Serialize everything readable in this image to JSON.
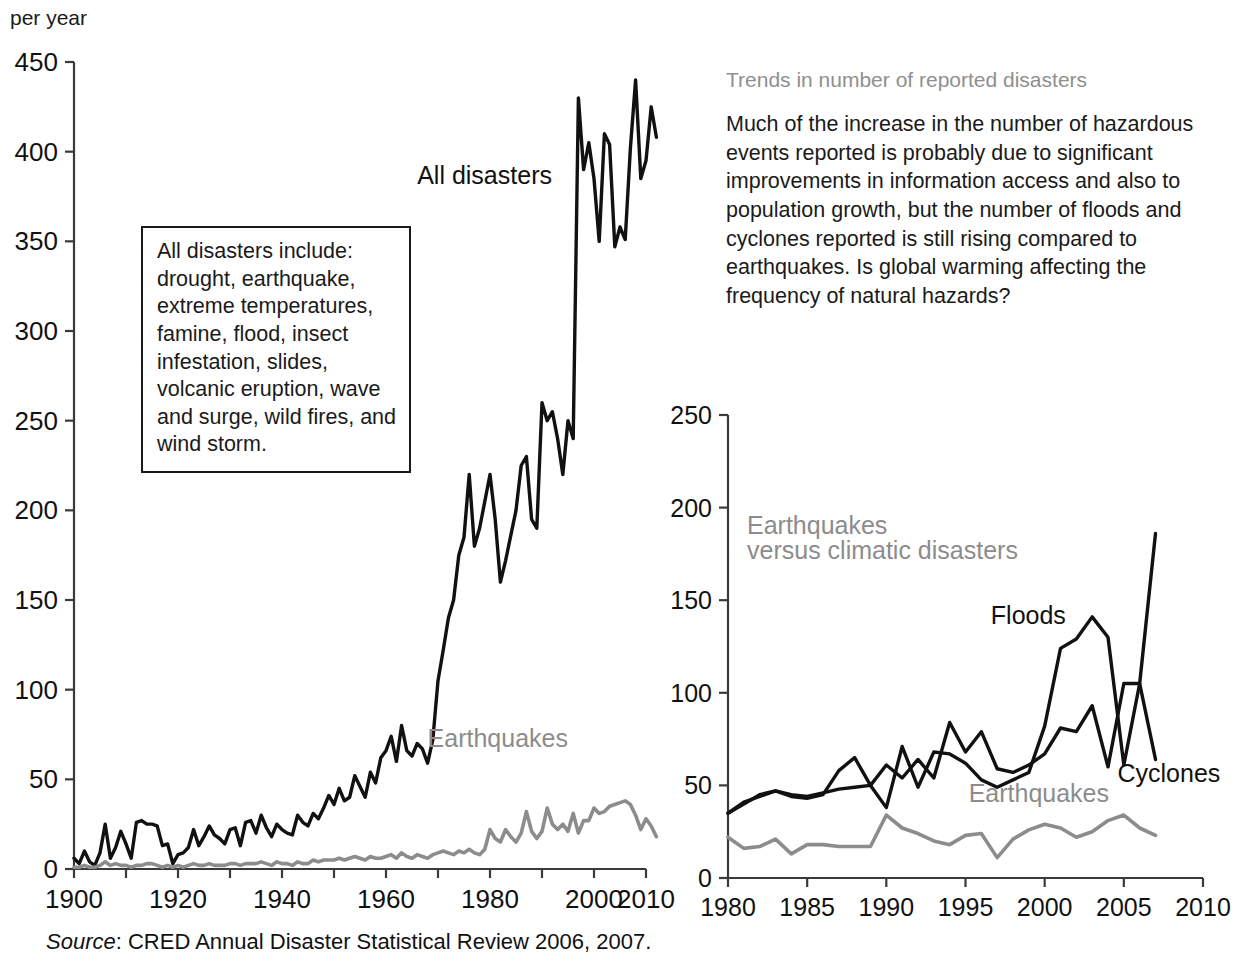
{
  "axis_label_top": "per year",
  "source": {
    "prefix": "Source",
    "text": ": CRED Annual Disaster Statistical Review 2006, 2007."
  },
  "sidebar": {
    "heading": "Trends in number of reported disasters",
    "body": "Much of the increase in the number of hazardous events reported is probably due to significant improvements in information access and also to population growth, but the number of floods and cyclones reported is still rising compared to earthquakes. Is global warming affecting the frequency of natural hazards?"
  },
  "callout": {
    "text": "All disasters include: drought, earthquake, extreme temperatures, famine, flood, insect infestation, slides, volcanic eruption, wave and surge, wild fires, and wind storm."
  },
  "chart_data": [
    {
      "id": "left",
      "type": "line",
      "title": "",
      "xlabel": "",
      "ylabel": "per year",
      "xlim": [
        1900,
        2010
      ],
      "ylim": [
        0,
        450
      ],
      "xticks": [
        1900,
        1910,
        1920,
        1930,
        1940,
        1950,
        1960,
        1970,
        1980,
        1990,
        2000,
        2010
      ],
      "xticklabels": [
        "1900",
        "",
        "1920",
        "",
        "1940",
        "",
        "1960",
        "",
        "1980",
        "",
        "2000",
        "2010"
      ],
      "yticks": [
        0,
        50,
        100,
        150,
        200,
        250,
        300,
        350,
        400,
        450
      ],
      "yticklabels": [
        "0",
        "50",
        "100",
        "150",
        "200",
        "250",
        "300",
        "350",
        "400",
        "450"
      ],
      "grid": false,
      "legend": "inline-annotations",
      "annotations": [
        {
          "text": "All disasters",
          "x": 1966,
          "y": 382,
          "color": "#111111"
        },
        {
          "text": "Earthquakes",
          "x": 1968,
          "y": 68,
          "color": "#8f8f8f"
        }
      ],
      "series": [
        {
          "name": "All disasters",
          "color": "#111111",
          "x": [
            1900,
            1901,
            1902,
            1903,
            1904,
            1905,
            1906,
            1907,
            1908,
            1909,
            1910,
            1911,
            1912,
            1913,
            1914,
            1915,
            1916,
            1917,
            1918,
            1919,
            1920,
            1921,
            1922,
            1923,
            1924,
            1925,
            1926,
            1927,
            1928,
            1929,
            1930,
            1931,
            1932,
            1933,
            1934,
            1935,
            1936,
            1937,
            1938,
            1939,
            1940,
            1941,
            1942,
            1943,
            1944,
            1945,
            1946,
            1947,
            1948,
            1949,
            1950,
            1951,
            1952,
            1953,
            1954,
            1955,
            1956,
            1957,
            1958,
            1959,
            1960,
            1961,
            1962,
            1963,
            1964,
            1965,
            1966,
            1967,
            1968,
            1969,
            1970,
            1971,
            1972,
            1973,
            1974,
            1975,
            1976,
            1977,
            1978,
            1979,
            1980,
            1981,
            1982,
            1983,
            1984,
            1985,
            1986,
            1987,
            1988,
            1989,
            1990,
            1991,
            1992,
            1993,
            1994,
            1995,
            1996,
            1997,
            1998,
            1999,
            2000,
            2001,
            2002,
            2003,
            2004,
            2005,
            2006,
            2007,
            2008,
            2009,
            2010,
            2011,
            2012
          ],
          "values": [
            6,
            3,
            10,
            4,
            2,
            9,
            25,
            6,
            12,
            21,
            14,
            6,
            26,
            27,
            25,
            25,
            24,
            13,
            14,
            3,
            8,
            9,
            12,
            22,
            13,
            18,
            24,
            19,
            17,
            14,
            22,
            23,
            13,
            26,
            27,
            20,
            30,
            23,
            18,
            25,
            22,
            20,
            19,
            30,
            26,
            24,
            31,
            28,
            34,
            41,
            36,
            45,
            38,
            40,
            52,
            46,
            40,
            54,
            48,
            62,
            66,
            74,
            60,
            80,
            66,
            63,
            70,
            67,
            59,
            72,
            105,
            122,
            140,
            150,
            175,
            185,
            220,
            180,
            190,
            205,
            220,
            195,
            160,
            172,
            186,
            200,
            225,
            230,
            195,
            190,
            260,
            250,
            255,
            240,
            220,
            250,
            240,
            430,
            390,
            405,
            385,
            350,
            410,
            404,
            347,
            358,
            351,
            402,
            440,
            385,
            395,
            425,
            408
          ]
        },
        {
          "name": "Earthquakes",
          "color": "#8f8f8f",
          "x": [
            1900,
            1901,
            1902,
            1903,
            1904,
            1905,
            1906,
            1907,
            1908,
            1909,
            1910,
            1911,
            1912,
            1913,
            1914,
            1915,
            1916,
            1917,
            1918,
            1919,
            1920,
            1921,
            1922,
            1923,
            1924,
            1925,
            1926,
            1927,
            1928,
            1929,
            1930,
            1931,
            1932,
            1933,
            1934,
            1935,
            1936,
            1937,
            1938,
            1939,
            1940,
            1941,
            1942,
            1943,
            1944,
            1945,
            1946,
            1947,
            1948,
            1949,
            1950,
            1951,
            1952,
            1953,
            1954,
            1955,
            1956,
            1957,
            1958,
            1959,
            1960,
            1961,
            1962,
            1963,
            1964,
            1965,
            1966,
            1967,
            1968,
            1969,
            1970,
            1971,
            1972,
            1973,
            1974,
            1975,
            1976,
            1977,
            1978,
            1979,
            1980,
            1981,
            1982,
            1983,
            1984,
            1985,
            1986,
            1987,
            1988,
            1989,
            1990,
            1991,
            1992,
            1993,
            1994,
            1995,
            1996,
            1997,
            1998,
            1999,
            2000,
            2001,
            2002,
            2003,
            2004,
            2005,
            2006,
            2007,
            2008,
            2009,
            2010,
            2011,
            2012
          ],
          "values": [
            1,
            1,
            2,
            1,
            1,
            2,
            4,
            2,
            3,
            2,
            2,
            1,
            2,
            2,
            3,
            3,
            2,
            1,
            2,
            1,
            2,
            1,
            2,
            3,
            2,
            2,
            3,
            2,
            2,
            2,
            3,
            3,
            2,
            3,
            3,
            3,
            4,
            3,
            2,
            4,
            3,
            3,
            2,
            4,
            3,
            3,
            5,
            4,
            5,
            5,
            5,
            6,
            5,
            6,
            7,
            6,
            5,
            7,
            6,
            6,
            7,
            8,
            6,
            9,
            7,
            6,
            8,
            7,
            6,
            8,
            9,
            10,
            9,
            8,
            10,
            9,
            11,
            9,
            8,
            11,
            22,
            17,
            15,
            22,
            18,
            15,
            20,
            32,
            21,
            17,
            21,
            34,
            25,
            22,
            25,
            21,
            31,
            20,
            27,
            27,
            34,
            31,
            32,
            35,
            36,
            37,
            38,
            36,
            30,
            22,
            28,
            24,
            18
          ]
        }
      ]
    },
    {
      "id": "right",
      "type": "line",
      "title": "Earthquakes versus climatic disasters",
      "xlabel": "",
      "ylabel": "",
      "xlim": [
        1980,
        2010
      ],
      "ylim": [
        0,
        250
      ],
      "xticks": [
        1980,
        1985,
        1990,
        1995,
        2000,
        2005,
        2010
      ],
      "xticklabels": [
        "1980",
        "1985",
        "1990",
        "1995",
        "2000",
        "2005",
        "2010"
      ],
      "yticks": [
        0,
        50,
        100,
        150,
        200,
        250
      ],
      "yticklabels": [
        "0",
        "50",
        "100",
        "150",
        "200",
        "250"
      ],
      "grid": false,
      "legend": "inline-annotations",
      "annotations": [
        {
          "text": "Earthquakes",
          "x": 1981.2,
          "y": 186,
          "color": "#8f8f8f"
        },
        {
          "text": "versus climatic disasters",
          "x": 1981.2,
          "y": 172,
          "color": "#8f8f8f"
        },
        {
          "text": "Floods",
          "x": 1996.6,
          "y": 137,
          "color": "#111111"
        },
        {
          "text": "Cyclones",
          "x": 2004.6,
          "y": 52,
          "color": "#111111"
        },
        {
          "text": "Earthquakes",
          "x": 1995.2,
          "y": 41,
          "color": "#8f8f8f"
        }
      ],
      "series": [
        {
          "name": "Floods",
          "color": "#111111",
          "x": [
            1980,
            1981,
            1982,
            1983,
            1984,
            1985,
            1986,
            1987,
            1988,
            1989,
            1990,
            1991,
            1992,
            1993,
            1994,
            1995,
            1996,
            1997,
            1998,
            1999,
            2000,
            2001,
            2002,
            2003,
            2004,
            2005,
            2006,
            2007
          ],
          "values": [
            35,
            40,
            45,
            47,
            45,
            44,
            46,
            48,
            49,
            50,
            38,
            71,
            49,
            68,
            67,
            62,
            53,
            49,
            53,
            57,
            82,
            124,
            129,
            141,
            130,
            61,
            105,
            186
          ]
        },
        {
          "name": "Cyclones",
          "color": "#111111",
          "x": [
            1980,
            1981,
            1982,
            1983,
            1984,
            1985,
            1986,
            1987,
            1988,
            1989,
            1990,
            1991,
            1992,
            1993,
            1994,
            1995,
            1996,
            1997,
            1998,
            1999,
            2000,
            2001,
            2002,
            2003,
            2004,
            2005,
            2006,
            2007
          ],
          "values": [
            35,
            41,
            44,
            47,
            44,
            43,
            45,
            58,
            65,
            50,
            61,
            54,
            64,
            54,
            84,
            68,
            79,
            59,
            57,
            61,
            67,
            81,
            79,
            93,
            60,
            105,
            105,
            64
          ]
        },
        {
          "name": "Earthquakes",
          "color": "#8f8f8f",
          "x": [
            1980,
            1981,
            1982,
            1983,
            1984,
            1985,
            1986,
            1987,
            1988,
            1989,
            1990,
            1991,
            1992,
            1993,
            1994,
            1995,
            1996,
            1997,
            1998,
            1999,
            2000,
            2001,
            2002,
            2003,
            2004,
            2005,
            2006,
            2007
          ],
          "values": [
            22,
            16,
            17,
            21,
            13,
            18,
            18,
            17,
            17,
            17,
            34,
            27,
            24,
            20,
            18,
            23,
            24,
            11,
            21,
            26,
            29,
            27,
            22,
            25,
            31,
            34,
            27,
            23
          ]
        }
      ]
    }
  ]
}
